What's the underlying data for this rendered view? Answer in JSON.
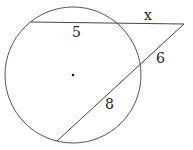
{
  "diagram": {
    "type": "circle-secants",
    "circle": {
      "cx": 73,
      "cy": 75,
      "r": 68,
      "stroke": "#555555"
    },
    "center_dot": {
      "cx": 73,
      "cy": 75,
      "r": 1.3
    },
    "external_point": {
      "x": 184,
      "y": 24
    },
    "secant_top": {
      "far_point": {
        "x": 31,
        "y": 22
      },
      "near_point": {
        "x": 120,
        "y": 23
      },
      "internal_label": "5",
      "external_label": "x"
    },
    "secant_bottom": {
      "far_point": {
        "x": 57,
        "y": 141
      },
      "near_point": {
        "x": 142,
        "y": 63
      },
      "internal_label": "8",
      "external_label": "6"
    },
    "labels": [
      {
        "id": "x",
        "text": "x",
        "x": 144,
        "y": 20
      },
      {
        "id": "five",
        "text": "5",
        "x": 72,
        "y": 37
      },
      {
        "id": "six",
        "text": "6",
        "x": 156,
        "y": 63
      },
      {
        "id": "eight",
        "text": "8",
        "x": 105,
        "y": 109
      }
    ]
  }
}
